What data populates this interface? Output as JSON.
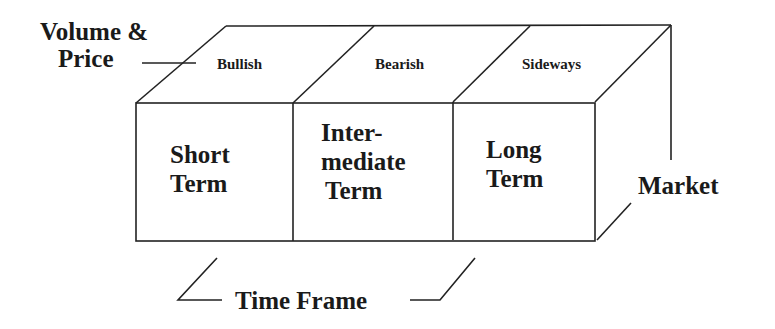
{
  "diagram": {
    "axes": {
      "top_axis_label_line1": "Volume &",
      "top_axis_label_line2": "Price",
      "side_axis_label": "Market",
      "bottom_axis_label": "Time Frame"
    },
    "top_face": [
      "Bullish",
      "Bearish",
      "Sideways"
    ],
    "front_face": [
      {
        "lines": [
          "Short",
          "Term"
        ]
      },
      {
        "lines": [
          "Inter-",
          "mediate",
          "Term"
        ]
      },
      {
        "lines": [
          "Long",
          "Term"
        ]
      }
    ],
    "colors": {
      "line": "#222222",
      "text": "#1a1a1a",
      "background": "#ffffff"
    }
  }
}
